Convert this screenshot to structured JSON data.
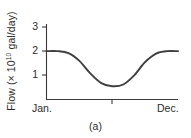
{
  "figure": {
    "caption": "(a)"
  },
  "chart_data": {
    "type": "line",
    "title": "",
    "subtitle": "",
    "xlabel": "",
    "ylabel": "Flow (× 10¹⁰ gal/day)",
    "ylabel_parts": {
      "prefix": "Flow (× 10",
      "exponent": "10",
      "suffix": " gal/day)"
    },
    "x_tick_labels": [
      "Jan.",
      "Dec."
    ],
    "x_tick_left": "Jan.",
    "x_tick_right": "Dec.",
    "x_mid_tick": true,
    "y_tick_labels": [
      "1",
      "2",
      "3"
    ],
    "ylim": [
      0,
      3
    ],
    "xlim": [
      0,
      12
    ],
    "grid": false,
    "legend": false,
    "series": [
      {
        "name": "Flow",
        "color": "#3f3f3f",
        "x": [
          0,
          1,
          2,
          3,
          4,
          5,
          6,
          7,
          8,
          9,
          10,
          11,
          12
        ],
        "values": [
          2.0,
          2.0,
          1.92,
          1.6,
          1.08,
          0.68,
          0.55,
          0.62,
          1.0,
          1.55,
          1.9,
          2.0,
          2.0
        ]
      }
    ],
    "annotations": []
  },
  "colors": {
    "axis": "#3a3a3a",
    "curve": "#3f3f3f",
    "text": "#2b2b2b",
    "background": "#ffffff"
  }
}
